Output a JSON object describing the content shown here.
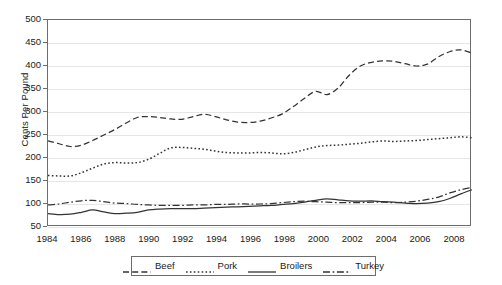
{
  "chart_data": {
    "type": "line",
    "title": "",
    "xlabel": "",
    "ylabel": "Cents Per Pound",
    "xlim": [
      1984,
      2009
    ],
    "ylim": [
      50,
      500
    ],
    "ytick_step": 50,
    "grid": true,
    "legend_position": "bottom",
    "yticks": [
      "500",
      "450",
      "400",
      "350",
      "300",
      "250",
      "200",
      "150",
      "100",
      "50"
    ],
    "xticks": [
      "1984",
      "1986",
      "1988",
      "1990",
      "1992",
      "1994",
      "1996",
      "1998",
      "2000",
      "2002",
      "2004",
      "2006",
      "2008"
    ],
    "x": [
      1984,
      1985,
      1986,
      1987,
      1988,
      1989,
      1990,
      1991,
      1992,
      1993,
      1994,
      1995,
      1996,
      1997,
      1998,
      1999,
      2000,
      2001,
      2002,
      2003,
      2004,
      2005,
      2006,
      2007,
      2008,
      2009
    ],
    "series": [
      {
        "name": "Beef",
        "style": "dashed",
        "color": "#333333",
        "values": [
          237,
          231,
          225,
          238,
          252,
          266,
          281,
          288,
          288,
          285,
          284,
          294,
          290,
          281,
          277,
          281,
          285,
          287,
          296,
          313,
          322,
          306,
          320,
          345,
          338,
          360
        ]
      },
      {
        "name": "Pork",
        "style": "dotted",
        "color": "#333333",
        "values": [
          162,
          161,
          168,
          179,
          187,
          191,
          189,
          197,
          209,
          222,
          222,
          220,
          214,
          211,
          211,
          212,
          209,
          215,
          224,
          227,
          230,
          232,
          236,
          237,
          238,
          241
        ]
      },
      {
        "name": "Broilers",
        "style": "solid",
        "color": "#5a5a5a",
        "values": [
          79,
          77,
          81,
          87,
          83,
          79,
          81,
          87,
          89,
          90,
          90,
          91,
          93,
          95,
          96,
          97,
          100,
          102,
          108,
          111,
          107,
          107,
          104,
          102,
          104,
          109
        ]
      },
      {
        "name": "Turkey",
        "style": "dashdot",
        "color": "#4a4a4a",
        "values": [
          98,
          100,
          105,
          108,
          105,
          103,
          101,
          98,
          97,
          97,
          98,
          98,
          99,
          99,
          100,
          100,
          101,
          104,
          105,
          106,
          104,
          103,
          103,
          104,
          108,
          113
        ]
      }
    ],
    "series_tail": {
      "beef": [
        380,
        400,
        408,
        411,
        410,
        409,
        408,
        400,
        404,
        420,
        431,
        435,
        428
      ],
      "note": "continuation beyond 2005 handled in path data"
    }
  },
  "legend": {
    "items": [
      {
        "label": "Beef",
        "style": "dashed"
      },
      {
        "label": "Pork",
        "style": "dotted"
      },
      {
        "label": "Broilers",
        "style": "solid"
      },
      {
        "label": "Turkey",
        "style": "dashdot"
      }
    ]
  },
  "colors": {
    "axis": "#6d6d6d",
    "grid": "#e6e6e6",
    "line": "#333333",
    "background": "#ffffff"
  }
}
